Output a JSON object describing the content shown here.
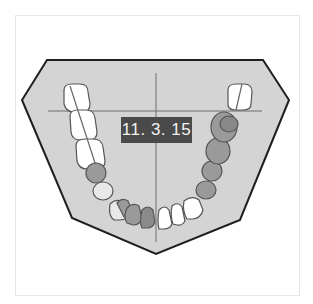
{
  "diagram": {
    "date_label": "11. 3. 15",
    "colors": {
      "plate_fill": "#d4d4d4",
      "plate_stroke": "#1e1e1e",
      "crosshair": "#6e6e6e",
      "tooth_white": "#ffffff",
      "tooth_shaded": "#9a9a9a",
      "tooth_outline": "#555555",
      "label_bg": "#4a4a4a",
      "label_text": "#f2f2f2"
    },
    "teeth": {
      "left_side_white_molars": 3,
      "left_side_shaded_premolars": 2,
      "anterior_shaded": 3,
      "anterior_white": 3,
      "right_side_shaded": 5,
      "right_side_white_molar": 1
    }
  }
}
